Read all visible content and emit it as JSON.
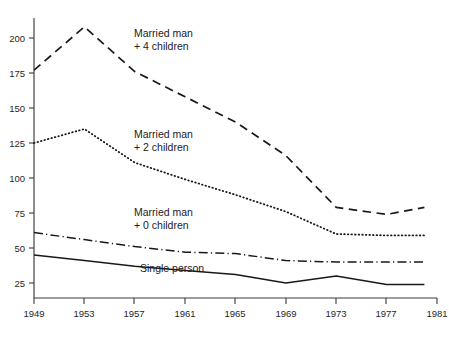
{
  "chart_data": {
    "type": "line",
    "title": "",
    "subtitle": "",
    "xlabel": "",
    "ylabel": "",
    "xlim": [
      1949,
      1981
    ],
    "ylim": [
      0,
      215
    ],
    "grid": false,
    "legend_position": "inline-annotations",
    "x": [
      1949,
      1953,
      1957,
      1961,
      1965,
      1969,
      1973,
      1977,
      1980
    ],
    "xticks": [
      "1949",
      "1953",
      "1957",
      "1961",
      "1965",
      "1969",
      "1973",
      "1977",
      "1981"
    ],
    "yticks": [
      "25",
      "50",
      "75",
      "100",
      "125",
      "150",
      "175",
      "200"
    ],
    "ytick_values": [
      25,
      50,
      75,
      100,
      125,
      150,
      175,
      200
    ],
    "series": [
      {
        "name": "Married man + 4 children",
        "label_line1": "Married man",
        "label_line2": "+ 4 children",
        "style": "dashed",
        "values": [
          177,
          208,
          176,
          158,
          140,
          116,
          79,
          74,
          79
        ]
      },
      {
        "name": "Married man + 2 children",
        "label_line1": "Married man",
        "label_line2": "+ 2 children",
        "style": "dotted",
        "values": [
          125,
          135,
          111,
          99,
          88,
          76,
          60,
          59,
          59
        ]
      },
      {
        "name": "Married man + 0 children",
        "label_line1": "Married man",
        "label_line2": "+ 0 children",
        "style": "dash-dot",
        "values": [
          61,
          56,
          51,
          47,
          46,
          41,
          40,
          40,
          40
        ]
      },
      {
        "name": "Single person",
        "label_line1": "Single person",
        "label_line2": "",
        "style": "solid",
        "values": [
          45,
          41,
          37,
          34,
          31,
          25,
          30,
          24,
          24
        ]
      }
    ],
    "annotations": [
      {
        "text": "Married man",
        "x": 1953.6,
        "y": 195
      },
      {
        "text": "+ 4 children",
        "x": 1953.6,
        "y": 183
      },
      {
        "text": "Married man",
        "x": 1953.6,
        "y": 120
      },
      {
        "text": "+ 2 children",
        "x": 1953.6,
        "y": 108
      },
      {
        "text": "Married man",
        "x": 1953.6,
        "y": 64
      },
      {
        "text": "+ 0 children",
        "x": 1953.6,
        "y": 54
      },
      {
        "text": "Single person",
        "x": 1956.0,
        "y": 27
      }
    ]
  }
}
